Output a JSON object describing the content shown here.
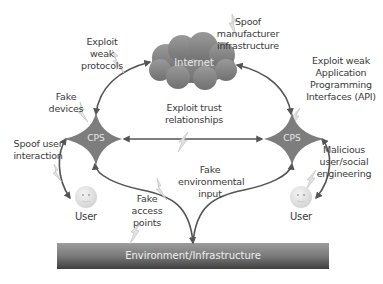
{
  "diagram": {
    "nodes": {
      "internet": {
        "label": "Internet",
        "shape": "cloud",
        "color": "#8a8a8a"
      },
      "cps_left": {
        "label": "CPS",
        "shape": "four-point-star",
        "color": "#7d7d7d"
      },
      "cps_right": {
        "label": "CPS",
        "shape": "four-point-star",
        "color": "#7d7d7d"
      },
      "user_left": {
        "label": "User",
        "shape": "smiley-face",
        "color": "#e6e6e6"
      },
      "user_right": {
        "label": "User",
        "shape": "smiley-face",
        "color": "#e6e6e6"
      },
      "environment": {
        "label": "Environment/Infrastructure",
        "shape": "gradient-bar",
        "color": "#6f6f6f"
      }
    },
    "attacks": {
      "exploit_weak_protocols": [
        "Exploit",
        "weak",
        "protocols"
      ],
      "spoof_manufacturer": [
        "Spoof",
        "manufacturer",
        "infrastructure"
      ],
      "exploit_weak_api": [
        "Exploit weak",
        "Application",
        "Programming",
        "Interfaces (API)"
      ],
      "fake_devices": [
        "Fake",
        "devices"
      ],
      "exploit_trust": [
        "Exploit trust",
        "relationships"
      ],
      "spoof_user_interaction": [
        "Spoof user",
        "interaction"
      ],
      "malicious_user": [
        "Malicious",
        "user/social",
        "engineering"
      ],
      "fake_environmental_input": [
        "Fake",
        "environmental",
        "input"
      ],
      "fake_access_points": [
        "Fake",
        "access",
        "points"
      ]
    },
    "edges": [
      {
        "from": "cps_left",
        "to": "internet",
        "style": "double-arrow"
      },
      {
        "from": "internet",
        "to": "cps_right",
        "style": "double-arrow"
      },
      {
        "from": "cps_left",
        "to": "cps_right",
        "style": "double-arrow"
      },
      {
        "from": "cps_left",
        "to": "user_left",
        "style": "double-arrow"
      },
      {
        "from": "cps_right",
        "to": "user_right",
        "style": "double-arrow"
      },
      {
        "from": "environment",
        "to": "cps_left",
        "style": "arrow"
      },
      {
        "from": "environment",
        "to": "cps_right",
        "style": "arrow"
      }
    ],
    "colors": {
      "arrow": "#555555",
      "lightning": "#d9d9d9",
      "text": "#3a3a3a"
    }
  }
}
